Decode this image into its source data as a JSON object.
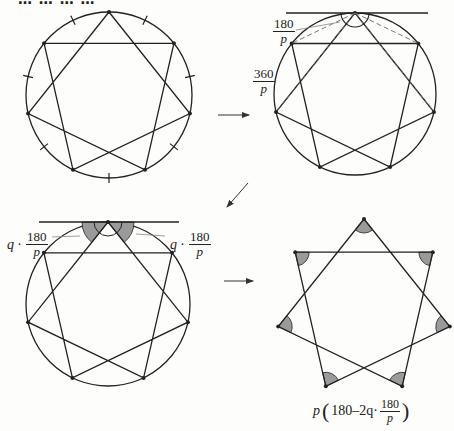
{
  "header": {
    "partial_text": "… … … …",
    "note": "text cropped at top edge, illegible"
  },
  "colors": {
    "stroke": "#222222",
    "dashed": "#666666",
    "angle_fill": "#9a9a9a",
    "background": "#fdfdfb"
  },
  "panels": [
    {
      "id": "panel-1",
      "description": "Circle divided into 7 equal arcs (tick marks) with inscribed heptagram {7/2}",
      "circle": {
        "cx": 109,
        "cy": 95,
        "r": 83
      },
      "points": 7,
      "step": 2,
      "tick_marks": 7
    },
    {
      "id": "panel-2",
      "description": "Tangent at top vertex; inscribed angles subtended by each arc equal 180/p; each arc spans 360/p",
      "circle": {
        "cx": 355,
        "cy": 94,
        "r": 81
      },
      "labels": {
        "inscribed_angle": {
          "num": "180",
          "den": "p"
        },
        "arc_angle": {
          "num": "360",
          "den": "p"
        }
      }
    },
    {
      "id": "panel-3",
      "description": "Shaded angles between tangent and star edges each equal q·180/p",
      "circle": {
        "cx": 108,
        "cy": 304,
        "r": 82
      },
      "labels": {
        "left": {
          "coef": "q ·",
          "num": "180",
          "den": "p"
        },
        "right": {
          "coef": "q ·",
          "num": "180",
          "den": "p"
        }
      }
    },
    {
      "id": "panel-4",
      "description": "Heptagram with shaded vertex angles; angle sum formula",
      "center": {
        "cx": 364,
        "cy": 307,
        "r": 88
      },
      "formula": {
        "p": "p",
        "open": "(",
        "body": "180–2q·",
        "num": "180",
        "den": "p",
        "close": ")"
      }
    }
  ],
  "arrows": [
    {
      "id": "arrow-right-top",
      "from": [
        218,
        115
      ],
      "to": [
        249,
        115
      ]
    },
    {
      "id": "arrow-diagonal",
      "from": [
        248,
        183
      ],
      "to": [
        227,
        207
      ]
    },
    {
      "id": "arrow-right-bottom",
      "from": [
        224,
        281
      ],
      "to": [
        253,
        281
      ]
    }
  ]
}
